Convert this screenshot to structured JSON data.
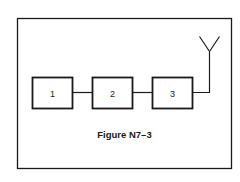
{
  "figure": {
    "caption": "Figure N7–3",
    "line_color": "#1a1a1a",
    "background": "#ffffff"
  },
  "blocks": [
    {
      "id": "block-1",
      "label": "1"
    },
    {
      "id": "block-2",
      "label": "2"
    },
    {
      "id": "block-3",
      "label": "3"
    }
  ],
  "antenna": {
    "icon": "antenna-icon"
  }
}
